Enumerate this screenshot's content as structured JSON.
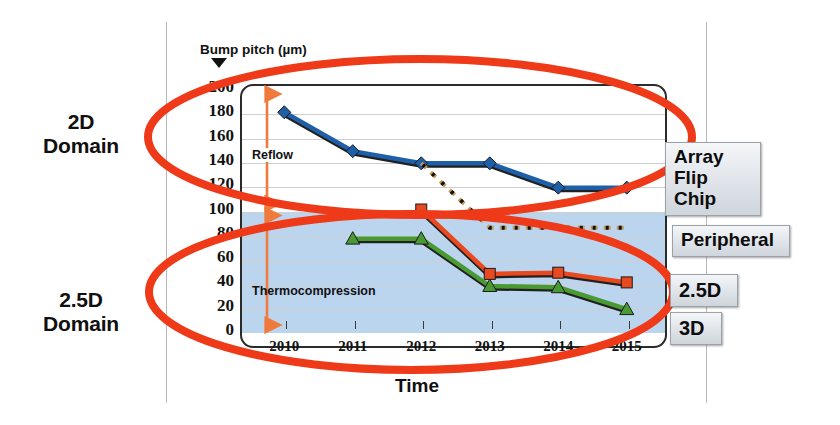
{
  "chart_data": {
    "type": "line",
    "title": "",
    "xlabel": "Time",
    "ylabel": "Bump pitch (µm)",
    "x": [
      "2010",
      "2011",
      "2012",
      "2013",
      "2014",
      "2015"
    ],
    "xlim": [
      2009.5,
      2015.5
    ],
    "ylim": [
      0,
      200
    ],
    "yticks": [
      0,
      20,
      40,
      60,
      80,
      100,
      120,
      140,
      160,
      180,
      200
    ],
    "grid": true,
    "legend_position": "right-callouts",
    "series": [
      {
        "name": "Array Flip Chip",
        "color": "#1f5fa8",
        "marker": "diamond",
        "style": "solid",
        "x": [
          "2010",
          "2011",
          "2012",
          "2013",
          "2014",
          "2015"
        ],
        "values": [
          180,
          148,
          138,
          138,
          118,
          118
        ]
      },
      {
        "name": "Peripheral",
        "color": "#c79a5a",
        "marker": "none",
        "style": "dashed",
        "x": [
          "2012",
          "2013",
          "2014",
          "2015"
        ],
        "values": [
          138,
          85,
          85,
          85
        ]
      },
      {
        "name": "2.5D",
        "color": "#e8491f",
        "marker": "square",
        "style": "solid",
        "x": [
          "2012",
          "2013",
          "2014",
          "2015"
        ],
        "values": [
          100,
          47,
          48,
          40
        ]
      },
      {
        "name": "3D",
        "color": "#4a9a34",
        "marker": "triangle",
        "style": "solid",
        "x": [
          "2011",
          "2012",
          "2013",
          "2014",
          "2015"
        ],
        "values": [
          76,
          76,
          37,
          36,
          18
        ]
      }
    ],
    "shaded_regions": [
      {
        "name": "thermocompression-band",
        "y_from": 0,
        "y_to": 100,
        "color": "#bcd5ef"
      }
    ],
    "annotations": [
      {
        "name": "reflow",
        "text": "Reflow",
        "y_from": 100,
        "y_to": 200,
        "arrow": "double",
        "color": "#f07a3c"
      },
      {
        "name": "thermocompression",
        "text": "Thermocompression",
        "y_from": 0,
        "y_to": 100,
        "arrow": "double",
        "color": "#f07a3c"
      }
    ],
    "highlight_ellipses": [
      {
        "name": "2d-domain-ellipse",
        "label": "2D Domain",
        "color": "#ee3a18"
      },
      {
        "name": "25d-domain-ellipse",
        "label": "2.5D Domain",
        "color": "#ee3a18"
      }
    ]
  },
  "axes": {
    "y_title": "Bump pitch (µm)",
    "x_title": "Time",
    "y_ticks": [
      "200",
      "180",
      "160",
      "140",
      "120",
      "100",
      "80",
      "60",
      "40",
      "20",
      "0"
    ],
    "x_ticks": [
      "2010",
      "2011",
      "2012",
      "2013",
      "2014",
      "2015"
    ]
  },
  "annotations": {
    "reflow": "Reflow",
    "thermocompression": "Thermocompression"
  },
  "domains": {
    "upper": "2D\nDomain",
    "lower": "2.5D\nDomain"
  },
  "callouts": {
    "array_flip_chip": "Array\nFlip Chip",
    "peripheral": "Peripheral",
    "two_five_d": "2.5D",
    "three_d": "3D"
  },
  "colors": {
    "array_flip_chip": "#1f5fa8",
    "peripheral": "#c79a5a",
    "two_five_d": "#e8491f",
    "three_d": "#4a9a34",
    "highlight_ellipse": "#ee3a18",
    "arrow": "#f07a3c",
    "band": "#bcd5ef"
  }
}
